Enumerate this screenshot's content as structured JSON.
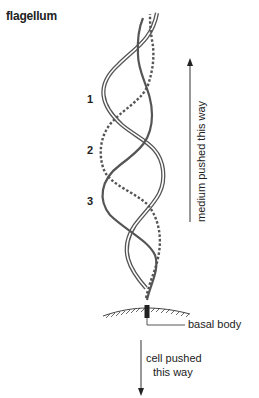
{
  "title": "flagellum",
  "wave_labels": [
    "1",
    "2",
    "3"
  ],
  "labels": {
    "medium_arrow": "medium pushed this way",
    "basal_body": "basal body",
    "cell_arrow_line1": "cell pushed",
    "cell_arrow_line2": "this way"
  },
  "colors": {
    "stroke": "#555555",
    "text": "#222222"
  }
}
